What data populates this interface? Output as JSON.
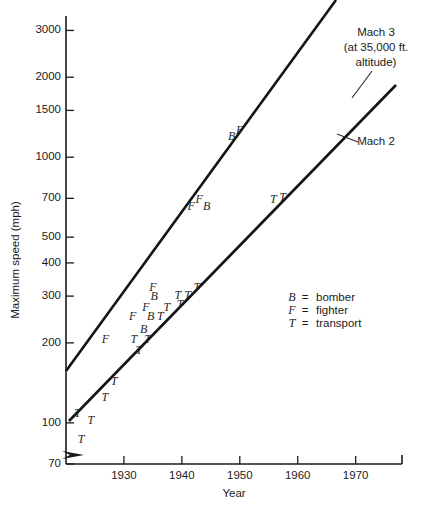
{
  "chart_data": {
    "type": "scatter",
    "title": "",
    "xlabel": "Year",
    "ylabel": "Maximum speed (mph)",
    "yscale": "log",
    "xscale": "linear",
    "xlim": [
      1920,
      1978
    ],
    "ylim": [
      70,
      3400
    ],
    "grid": false,
    "legend_position": "center-right",
    "axis_break": true,
    "yticks": [
      70,
      100,
      200,
      300,
      400,
      500,
      700,
      1000,
      1500,
      2000,
      3000
    ],
    "ytick_labels": [
      "70",
      "100",
      "200",
      "300",
      "400",
      "500",
      "700",
      "1000",
      "1500",
      "2000",
      "3000"
    ],
    "xticks": [
      1930,
      1940,
      1950,
      1960,
      1970
    ],
    "xtick_labels": [
      "1930",
      "1940",
      "1950",
      "1960",
      "1970"
    ],
    "legend": [
      {
        "symbol": "B",
        "equals": "=",
        "label": "bomber"
      },
      {
        "symbol": "F",
        "equals": "=",
        "label": "fighter"
      },
      {
        "symbol": "T",
        "equals": "=",
        "label": "transport"
      }
    ],
    "annotations": [
      {
        "name": "mach-3",
        "lines": [
          "Mach 3",
          "(at 35,000 ft.",
          "altitude)"
        ]
      },
      {
        "name": "mach-2",
        "lines": [
          "Mach 2"
        ]
      }
    ],
    "series": [
      {
        "name": "Upper envelope (fighters/bombers)",
        "type": "line",
        "points": [
          [
            1921.6,
            150
          ],
          [
            1973.0,
            3400
          ]
        ]
      },
      {
        "name": "Lower envelope (transports)",
        "type": "line",
        "points": [
          [
            1922.2,
            92
          ],
          [
            1974.5,
            2250
          ]
        ]
      }
    ],
    "points": [
      {
        "symbol": "T",
        "year": 1922.0,
        "speed": 108
      },
      {
        "symbol": "T",
        "year": 1922.6,
        "speed": 86
      },
      {
        "symbol": "T",
        "year": 1924.3,
        "speed": 101
      },
      {
        "symbol": "T",
        "year": 1926.7,
        "speed": 124
      },
      {
        "symbol": "T",
        "year": 1928.3,
        "speed": 142
      },
      {
        "symbol": "F",
        "year": 1926.8,
        "speed": 205
      },
      {
        "symbol": "T",
        "year": 1931.7,
        "speed": 205
      },
      {
        "symbol": "T",
        "year": 1932.6,
        "speed": 186
      },
      {
        "symbol": "B",
        "year": 1933.4,
        "speed": 224
      },
      {
        "symbol": "T",
        "year": 1934.1,
        "speed": 205
      },
      {
        "symbol": "F",
        "year": 1931.5,
        "speed": 250
      },
      {
        "symbol": "F",
        "year": 1933.8,
        "speed": 270
      },
      {
        "symbol": "B",
        "year": 1934.6,
        "speed": 250
      },
      {
        "symbol": "F",
        "year": 1935.0,
        "speed": 322
      },
      {
        "symbol": "B",
        "year": 1935.2,
        "speed": 296
      },
      {
        "symbol": "T",
        "year": 1936.3,
        "speed": 250
      },
      {
        "symbol": "T",
        "year": 1937.4,
        "speed": 270
      },
      {
        "symbol": "T",
        "year": 1939.3,
        "speed": 300
      },
      {
        "symbol": "T",
        "year": 1939.7,
        "speed": 278
      },
      {
        "symbol": "T",
        "year": 1941.0,
        "speed": 300
      },
      {
        "symbol": "T",
        "year": 1942.6,
        "speed": 322
      },
      {
        "symbol": "F",
        "year": 1941.6,
        "speed": 650
      },
      {
        "symbol": "F",
        "year": 1943.0,
        "speed": 690
      },
      {
        "symbol": "B",
        "year": 1944.3,
        "speed": 650
      },
      {
        "symbol": "B",
        "year": 1948.6,
        "speed": 1190
      },
      {
        "symbol": "F",
        "year": 1950.0,
        "speed": 1250
      },
      {
        "symbol": "T",
        "year": 1955.8,
        "speed": 690
      },
      {
        "symbol": "T",
        "year": 1957.4,
        "speed": 700
      }
    ]
  }
}
